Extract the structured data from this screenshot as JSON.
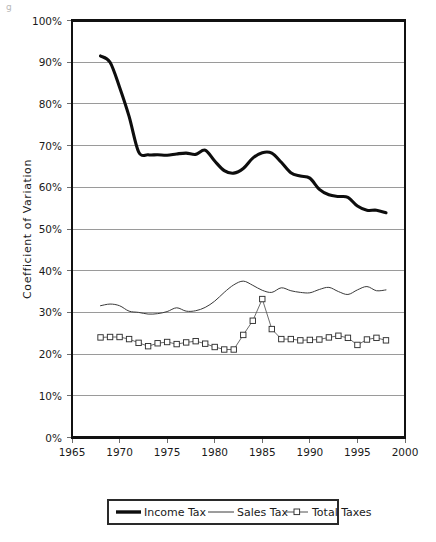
{
  "figure": {
    "background_color": "#ffffff",
    "corner_artifact_text": "g"
  },
  "chart_data": {
    "type": "line",
    "title": "",
    "subtitle": "",
    "xlabel": "",
    "ylabel": "Coefficient of Variation",
    "xlim": [
      1965,
      2000
    ],
    "ylim": [
      0,
      100
    ],
    "grid": true,
    "grid_axis": "y",
    "legend_position": "bottom",
    "y_tick_labels": [
      "0%",
      "10%",
      "20%",
      "30%",
      "40%",
      "50%",
      "60%",
      "70%",
      "80%",
      "90%",
      "100%"
    ],
    "y_tick_values": [
      0,
      10,
      20,
      30,
      40,
      50,
      60,
      70,
      80,
      90,
      100
    ],
    "x_tick_labels": [
      "1965",
      "1970",
      "1975",
      "1980",
      "1985",
      "1990",
      "1995",
      "2000"
    ],
    "x_tick_values": [
      1965,
      1970,
      1975,
      1980,
      1985,
      1990,
      1995,
      2000
    ],
    "x": [
      1968,
      1969,
      1970,
      1971,
      1972,
      1973,
      1974,
      1975,
      1976,
      1977,
      1978,
      1979,
      1980,
      1981,
      1982,
      1983,
      1984,
      1985,
      1986,
      1987,
      1988,
      1989,
      1990,
      1991,
      1992,
      1993,
      1994,
      1995,
      1996,
      1997,
      1998
    ],
    "series": [
      {
        "name": "Income Tax",
        "style": "thick-line",
        "color": "#0d0d0d",
        "marker": "none",
        "values": [
          91.5,
          90.0,
          84.0,
          77.0,
          68.5,
          67.8,
          67.8,
          67.7,
          68.0,
          68.2,
          67.9,
          68.9,
          66.3,
          64.0,
          63.4,
          64.5,
          67.0,
          68.3,
          68.2,
          66.0,
          63.5,
          62.7,
          62.2,
          59.5,
          58.2,
          57.8,
          57.6,
          55.5,
          54.5,
          54.5,
          53.9
        ]
      },
      {
        "name": "Sales Tax",
        "style": "thin-line",
        "color": "#3a3a3a",
        "marker": "none",
        "values": [
          31.6,
          32.0,
          31.6,
          30.3,
          30.0,
          29.6,
          29.7,
          30.2,
          31.1,
          30.3,
          30.4,
          31.2,
          32.7,
          34.8,
          36.6,
          37.5,
          36.5,
          35.3,
          34.8,
          35.9,
          35.2,
          34.8,
          34.7,
          35.5,
          36.0,
          35.0,
          34.3,
          35.4,
          36.2,
          35.2,
          35.4
        ]
      },
      {
        "name": "Total Taxes",
        "style": "thin-line-markers",
        "color": "#505050",
        "marker": "open-square",
        "values": [
          24.0,
          24.1,
          24.1,
          23.6,
          22.7,
          21.9,
          22.6,
          22.9,
          22.4,
          22.8,
          23.1,
          22.5,
          21.7,
          21.1,
          21.1,
          24.6,
          28.0,
          33.2,
          26.0,
          23.6,
          23.6,
          23.3,
          23.4,
          23.5,
          24.0,
          24.4,
          23.9,
          22.2,
          23.5,
          23.9,
          23.3
        ]
      }
    ],
    "annotations": []
  },
  "legend": {
    "entries": [
      {
        "label": "Income Tax",
        "swatch": "thick-line-swatch"
      },
      {
        "label": "Sales Tax",
        "swatch": "thin-line-swatch"
      },
      {
        "label": "Total Taxes",
        "swatch": "marker-line-swatch"
      }
    ]
  }
}
